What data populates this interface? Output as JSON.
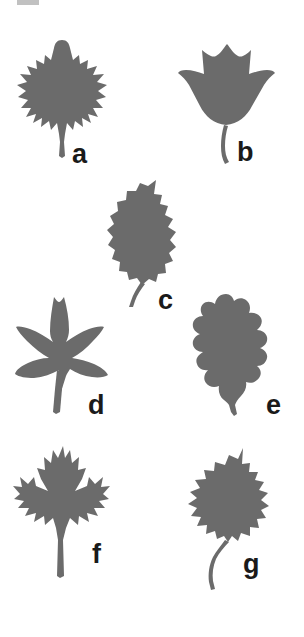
{
  "figure": {
    "background_color": "#ffffff",
    "leaf_fill_color": "#6b6b6b",
    "label_color": "#1a1a1a",
    "panel_count": 7,
    "top_crop_artifact": "partial-cut-text-mark"
  },
  "panels": [
    {
      "label": "a",
      "shape_name": "serrate-maple-like-leaf",
      "description": "broad triangular-ovate leaf with many small pointed serrations and a pointed apex, straight slender petiole",
      "label_x": 72,
      "label_y": 141,
      "leaf_x": 14,
      "leaf_y": 38
    },
    {
      "label": "b",
      "shape_name": "tuliptree-leaf",
      "description": "four-lobed tulip tree leaf with notched flat top and curved petiole",
      "label_x": 237,
      "label_y": 139,
      "leaf_x": 176,
      "leaf_y": 40
    },
    {
      "label": "c",
      "shape_name": "ovate-toothed-leaf",
      "description": "ovate birch-like leaf with coarse teeth along the margin and a slender curved petiole",
      "label_x": 158,
      "label_y": 287,
      "leaf_x": 100,
      "leaf_y": 178
    },
    {
      "label": "d",
      "shape_name": "star-shaped-palmate-leaf",
      "description": "five-lobed star-shaped sweetgum leaf with long straight petiole",
      "label_x": 88,
      "label_y": 392,
      "leaf_x": 8,
      "leaf_y": 294
    },
    {
      "label": "e",
      "shape_name": "lobed-oak-leaf",
      "description": "oak leaf with deep rounded lobes and rounded sinuses, short petiole",
      "label_x": 266,
      "label_y": 392,
      "leaf_x": 186,
      "leaf_y": 292
    },
    {
      "label": "f",
      "shape_name": "sharp-lobed-maple-leaf",
      "description": "classic maple leaf with five sharply pointed lobes and deep sinuses, long straight petiole",
      "label_x": 92,
      "label_y": 541,
      "leaf_x": 12,
      "leaf_y": 444
    },
    {
      "label": "g",
      "shape_name": "cottonwood-poplar-leaf",
      "description": "broad deltoid poplar leaf with coarse irregular teeth and a long curving petiole",
      "label_x": 243,
      "label_y": 551,
      "leaf_x": 180,
      "leaf_y": 446
    }
  ]
}
